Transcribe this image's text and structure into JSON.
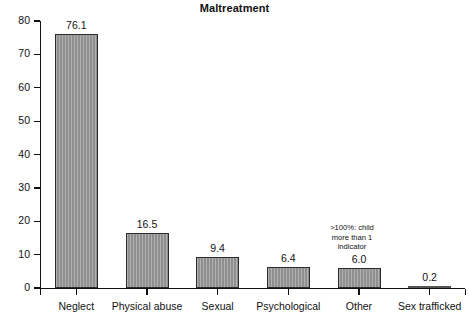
{
  "chart_data": {
    "type": "bar",
    "title": "Maltreatment",
    "xlabel": "",
    "ylabel": "",
    "ylim": [
      0,
      80
    ],
    "ytick_step": 10,
    "yticks": [
      "80",
      "70",
      "60",
      "50",
      "40",
      "30",
      "20",
      "10",
      "0"
    ],
    "grid": false,
    "legend": false,
    "categories": [
      "Neglect",
      "Physical abuse",
      "Sexual",
      "Psychological",
      "Other",
      "Sex trafficked"
    ],
    "values": [
      76.1,
      16.5,
      9.4,
      6.4,
      6.0,
      0.2
    ],
    "value_labels": [
      "76.1",
      "16.5",
      "9.4",
      "6.4",
      "6.0",
      "0.2"
    ],
    "annotations": [
      {
        "name": "over-100-note",
        "lines": [
          ">100%: child",
          "more than 1",
          "indicator"
        ],
        "text": ">100%: child more than 1 indicator"
      }
    ],
    "bar_fill_color": "#8f8f8f",
    "bar_border_color": "#2b2b2b",
    "axis_color": "#111111",
    "background_color": "#ffffff"
  }
}
